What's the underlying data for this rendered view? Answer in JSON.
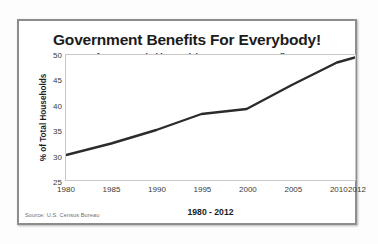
{
  "chart_data": {
    "type": "line",
    "title": "Government Benefits For Everybody!",
    "subtitle": "% of USA Households Receiving Government Benefits",
    "xlabel": "1980 - 2012",
    "ylabel": "% of Total Households",
    "source": "Source: U.S. Census Bureau",
    "x": [
      1980,
      1985,
      1990,
      1995,
      2000,
      2005,
      2010,
      2012
    ],
    "xtick_labels": [
      "1980",
      "1985",
      "1990",
      "1995",
      "2000",
      "2005",
      "2010",
      "2012"
    ],
    "values": [
      30.0,
      32.3,
      35.0,
      38.2,
      39.2,
      44.0,
      48.5,
      49.5
    ],
    "series": [
      {
        "name": "% of USA Households Receiving Government Benefits",
        "values": [
          30.0,
          32.3,
          35.0,
          38.2,
          39.2,
          44.0,
          48.5,
          49.5
        ]
      }
    ],
    "ylim": [
      25,
      50
    ],
    "xlim": [
      1980,
      2012
    ],
    "ytick_labels": [
      "25",
      "30",
      "35",
      "40",
      "45",
      "50"
    ],
    "yticks": [
      25,
      30,
      35,
      40,
      45,
      50
    ],
    "grid": false,
    "legend": "none",
    "line_color": "#2b2b2b",
    "plot_background": "#ffffff",
    "frame_color": "#8d8d8d"
  }
}
